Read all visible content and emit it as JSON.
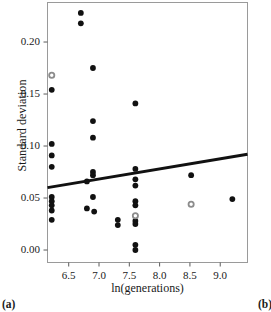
{
  "figure": {
    "panel_label_left": "(a)",
    "panel_label_right": "(b)"
  },
  "chart_data": {
    "type": "scatter",
    "title": "",
    "xlabel": "ln(generations)",
    "ylabel": "Standard deviation",
    "xlim": [
      6.15,
      9.45
    ],
    "ylim": [
      -0.012,
      0.238
    ],
    "xticks": [
      6.5,
      7.0,
      7.5,
      8.0,
      8.5,
      9.0
    ],
    "xticklabels": [
      "6.5",
      "7.0",
      "7.5",
      "8.0",
      "8.5",
      "9.0"
    ],
    "yticks": [
      0.0,
      0.05,
      0.1,
      0.15,
      0.2
    ],
    "yticklabels": [
      "0.00",
      "0.05",
      "0.10",
      "0.15",
      "0.20"
    ],
    "grid": false,
    "legend": null,
    "frame": true,
    "marker_color": "#111111",
    "open_marker_color": "#8c8c8c",
    "trendline_color": "#111111",
    "series": [
      {
        "name": "filled",
        "marker": "filled-circle",
        "color": "#111111",
        "points": [
          [
            6.22,
            0.154
          ],
          [
            6.22,
            0.102
          ],
          [
            6.22,
            0.091
          ],
          [
            6.22,
            0.08
          ],
          [
            6.22,
            0.051
          ],
          [
            6.22,
            0.047
          ],
          [
            6.22,
            0.043
          ],
          [
            6.22,
            0.038
          ],
          [
            6.22,
            0.029
          ],
          [
            6.7,
            0.228
          ],
          [
            6.7,
            0.218
          ],
          [
            6.8,
            0.066
          ],
          [
            6.8,
            0.04
          ],
          [
            6.9,
            0.175
          ],
          [
            6.9,
            0.124
          ],
          [
            6.9,
            0.108
          ],
          [
            6.9,
            0.075
          ],
          [
            6.9,
            0.072
          ],
          [
            6.9,
            0.051
          ],
          [
            6.92,
            0.037
          ],
          [
            7.31,
            0.029
          ],
          [
            7.31,
            0.024
          ],
          [
            7.6,
            0.141
          ],
          [
            7.6,
            0.078
          ],
          [
            7.6,
            0.068
          ],
          [
            7.6,
            0.062
          ],
          [
            7.6,
            0.047
          ],
          [
            7.6,
            0.043
          ],
          [
            7.6,
            0.028
          ],
          [
            7.6,
            0.025
          ],
          [
            7.6,
            0.005
          ],
          [
            7.6,
            0.0
          ],
          [
            8.52,
            0.072
          ],
          [
            9.2,
            0.049
          ]
        ]
      },
      {
        "name": "open-gray",
        "marker": "open-circle",
        "color": "#8c8c8c",
        "points": [
          [
            6.22,
            0.168
          ],
          [
            7.6,
            0.033
          ],
          [
            8.52,
            0.044
          ]
        ]
      }
    ],
    "trendline": {
      "type": "linear",
      "x": [
        6.15,
        9.45
      ],
      "y": [
        0.06,
        0.092
      ],
      "slope": 0.0097,
      "intercept": 0.0003,
      "width_px": 3
    }
  }
}
